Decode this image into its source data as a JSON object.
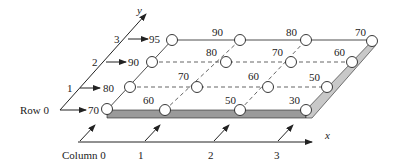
{
  "diagram": {
    "axes": {
      "x_label": "x",
      "y_label": "y"
    },
    "row_labels": [
      "Row 0",
      "1",
      "2",
      "3"
    ],
    "column_labels": [
      "Column 0",
      "1",
      "2",
      "3"
    ],
    "grid_values": [
      [
        70,
        60,
        50,
        30
      ],
      [
        80,
        70,
        60,
        50
      ],
      [
        90,
        80,
        70,
        60
      ],
      [
        95,
        90,
        80,
        70
      ]
    ],
    "row_edge_values": [
      "70",
      "80",
      "90",
      "95"
    ],
    "colors": {
      "line": "#222222",
      "shaded_edge": "#9a9a9a",
      "shaded_edge_light": "#c8c8c8",
      "node_fill": "#ffffff"
    }
  },
  "labels": {
    "r0c0": "",
    "r0c1": "60",
    "r0c2": "50",
    "r0c3": "30",
    "r1c0": "",
    "r1c1": "70",
    "r1c2": "60",
    "r1c3": "50",
    "r2c0": "",
    "r2c1": "80",
    "r2c2": "70",
    "r2c3": "60",
    "r3c0": "",
    "r3c1": "90",
    "r3c2": "80",
    "r3c3": "70"
  }
}
